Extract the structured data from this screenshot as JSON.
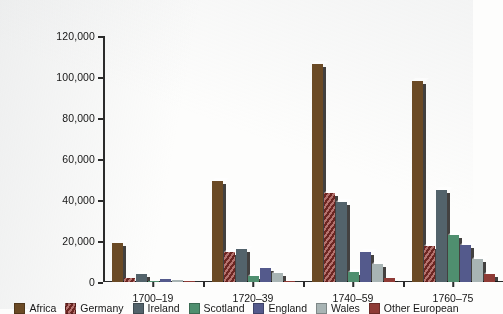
{
  "chart_data": {
    "type": "bar",
    "title": "",
    "subtitle": "",
    "xlabel": "",
    "ylabel": "",
    "grid": false,
    "legend_position": "bottom",
    "ylim": [
      0,
      120000
    ],
    "ytick_labels": [
      "120,000",
      "100,000",
      "80,000",
      "60,000",
      "40,000",
      "20,000",
      "0"
    ],
    "ytick_values": [
      120000,
      100000,
      80000,
      60000,
      40000,
      20000,
      0
    ],
    "categories": [
      "1700–19",
      "1720–39",
      "1740–59",
      "1760–75"
    ],
    "series": [
      {
        "name": "Africa",
        "color": "#6b4a25",
        "pattern": "solid",
        "values": [
          19000,
          49500,
          106500,
          98000
        ]
      },
      {
        "name": "Germany",
        "color": "#b4726e",
        "pattern": "diagonal",
        "values": [
          2000,
          14500,
          43500,
          17500
        ]
      },
      {
        "name": "Ireland",
        "color": "#53636b",
        "pattern": "solid",
        "values": [
          4000,
          16000,
          39000,
          45000
        ]
      },
      {
        "name": "Scotland",
        "color": "#4f8f6f",
        "pattern": "solid",
        "values": [
          300,
          3000,
          5000,
          23000
        ]
      },
      {
        "name": "England",
        "color": "#545a8c",
        "pattern": "solid",
        "values": [
          1500,
          7000,
          14500,
          18000
        ]
      },
      {
        "name": "Wales",
        "color": "#a8b4b4",
        "pattern": "solid",
        "values": [
          800,
          4500,
          9000,
          11000
        ]
      },
      {
        "name": "Other European",
        "color": "#8f3b36",
        "pattern": "solid",
        "values": [
          400,
          700,
          1800,
          4000
        ]
      }
    ]
  },
  "axis": {
    "y_ticks": [
      {
        "label": "120,000"
      },
      {
        "label": "100,000"
      },
      {
        "label": "80,000"
      },
      {
        "label": "60,000"
      },
      {
        "label": "40,000"
      },
      {
        "label": "20,000"
      },
      {
        "label": "0"
      }
    ]
  }
}
